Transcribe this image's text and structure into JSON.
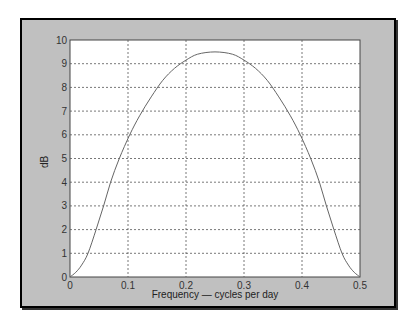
{
  "chart_data": {
    "type": "line",
    "title": "",
    "xlabel": "Frequency — cycles per day",
    "ylabel": "dB",
    "xlim": [
      0,
      0.5
    ],
    "ylim": [
      0,
      10
    ],
    "grid": true,
    "xticks": [
      "0",
      "0.1",
      "0.2",
      "0.3",
      "0.4",
      "0.5"
    ],
    "yticks": [
      "0",
      "1",
      "2",
      "3",
      "4",
      "5",
      "6",
      "7",
      "8",
      "9",
      "10"
    ],
    "series": [
      {
        "name": "response",
        "color": "#666666",
        "x": [
          0,
          0.01,
          0.02,
          0.031,
          0.045,
          0.058,
          0.07,
          0.085,
          0.103,
          0.12,
          0.14,
          0.16,
          0.18,
          0.2,
          0.22,
          0.25,
          0.28,
          0.3,
          0.32,
          0.34,
          0.36,
          0.38,
          0.397,
          0.415,
          0.43,
          0.442,
          0.455,
          0.469,
          0.48,
          0.49,
          0.5
        ],
        "y": [
          0,
          0.2,
          0.5,
          1.0,
          2.0,
          3.0,
          4.0,
          5.0,
          6.0,
          6.8,
          7.6,
          8.3,
          8.8,
          9.15,
          9.4,
          9.5,
          9.4,
          9.15,
          8.8,
          8.3,
          7.6,
          6.8,
          6.0,
          5.0,
          4.0,
          3.0,
          2.0,
          1.0,
          0.5,
          0.2,
          0
        ]
      }
    ]
  },
  "axes": {
    "xlabel": "Frequency — cycles per day",
    "ylabel": "dB"
  },
  "colors": {
    "frame_bg": "#c0c0c0",
    "plot_bg": "#ffffff",
    "grid": "#555555",
    "line": "#666666"
  }
}
